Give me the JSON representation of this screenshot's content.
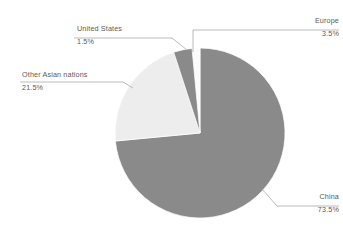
{
  "chart_data": {
    "type": "pie",
    "title": "",
    "categories": [
      "China",
      "Other Asian nations",
      "Europe",
      "United States"
    ],
    "values": [
      73.5,
      21.5,
      3.5,
      1.5
    ],
    "value_suffix": "%",
    "legend_position": "callout-labels",
    "grid": false,
    "colors": {
      "China": "#8a8a8a",
      "Other Asian nations": "#ededed",
      "Europe": "#8a8a8a",
      "United States": "#fbfbfb"
    },
    "slices": [
      {
        "label": "China",
        "value": "73.5%",
        "color": "#8a8a8a"
      },
      {
        "label": "Other Asian nations",
        "value": "21.5%",
        "color": "#ededed"
      },
      {
        "label": "Europe",
        "value": "3.5%",
        "color": "#8a8a8a"
      },
      {
        "label": "United States",
        "value": "1.5%",
        "color": "#fbfbfb"
      }
    ]
  },
  "labels": {
    "europe": {
      "name": "Europe",
      "value": "3.5%"
    },
    "united_states": {
      "name": "United States",
      "value": "1.5%"
    },
    "other_asian": {
      "name": "Other Asian nations",
      "value": "21.5%"
    },
    "china": {
      "name": "China",
      "value": "73.5%"
    }
  },
  "style": {
    "background": "#ffffff",
    "text_color": "#59595b",
    "leader_line_color": "#a9a9ab",
    "slice_stroke": "#ffffff"
  }
}
